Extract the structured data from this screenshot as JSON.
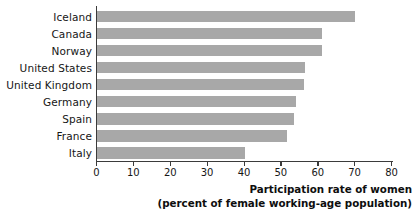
{
  "chart_data": {
    "type": "bar",
    "orientation": "horizontal",
    "title": "",
    "xlabel": "Participation rate of women (percent of female working-age population)",
    "ylabel": "",
    "xlim": [
      0,
      80
    ],
    "xticks": [
      "0",
      "10",
      "20",
      "30",
      "40",
      "50",
      "60",
      "70",
      "80"
    ],
    "grid": false,
    "legend": null,
    "bar_color": "#a8a8a8",
    "axis_color": "#3b3b3b",
    "categories": [
      "Iceland",
      "Canada",
      "Norway",
      "United States",
      "United Kingdom",
      "Germany",
      "Spain",
      "France",
      "Italy"
    ],
    "values": [
      70,
      61,
      61,
      56.5,
      56,
      54,
      53.5,
      51.5,
      40
    ]
  },
  "axis_title": {
    "line1": "Participation rate of women",
    "line2": "(percent of female working-age population)"
  }
}
